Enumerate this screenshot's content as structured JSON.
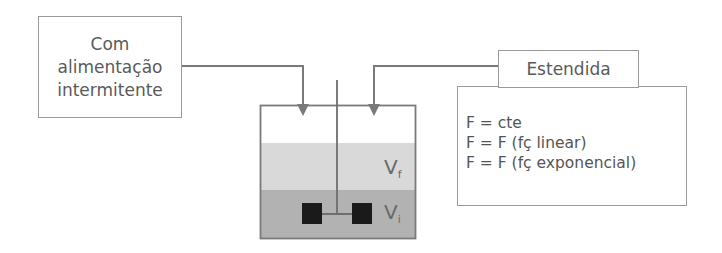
{
  "left_box": {
    "lines": [
      "Com",
      "alimentação",
      "intermitente"
    ]
  },
  "right_header_box": {
    "label": "Estendida"
  },
  "formulas_box": {
    "lines": [
      "F = cte",
      "F = F (fç linear)",
      "F = F (fç exponencial)"
    ]
  },
  "reactor": {
    "final_volume_label": "V",
    "final_volume_sub": "f",
    "initial_volume_label": "V",
    "initial_volume_sub": "i"
  },
  "colors": {
    "line": "#7a7a7a",
    "box_border": "#9a9a9a",
    "liquid_light": "#d8d8d8",
    "liquid_dark": "#b0b0b0",
    "impeller": "#1a1a1a"
  }
}
